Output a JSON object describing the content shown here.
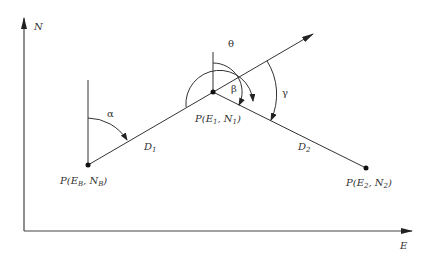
{
  "diagram": {
    "axes": {
      "vertical_label": "N",
      "horizontal_label": "E"
    },
    "points": {
      "backsight": {
        "label_main": "P(E",
        "sub1": "B",
        "mid": ", N",
        "sub2": "B",
        "end": ")"
      },
      "station": {
        "label_main": "P(E",
        "sub1": "1",
        "mid": ", N",
        "sub2": "1",
        "end": ")"
      },
      "foresight": {
        "label_main": "P(E",
        "sub1": "2",
        "mid": ", N",
        "sub2": "2",
        "end": ")"
      }
    },
    "distances": {
      "d1": {
        "main": "D",
        "sub": "1"
      },
      "d2": {
        "main": "D",
        "sub": "2"
      }
    },
    "angles": {
      "alpha": "α",
      "beta": "β",
      "theta": "θ",
      "gamma": "γ"
    },
    "colors": {
      "line": "#333333",
      "background": "#ffffff"
    }
  }
}
